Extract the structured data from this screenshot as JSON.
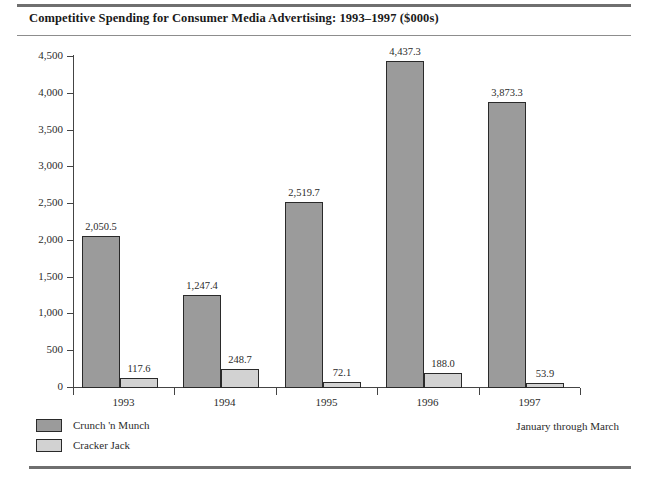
{
  "chart_data": {
    "type": "bar",
    "title": "Competitive Spending for Consumer Media Advertising: 1993–1997 ($000s)",
    "xlabel": "",
    "ylabel": "",
    "categories": [
      "1993",
      "1994",
      "1995",
      "1996",
      "1997"
    ],
    "series": [
      {
        "name": "Crunch 'n Munch",
        "color": "#9b9b9b",
        "values": [
          2050.5,
          1247.4,
          2519.7,
          4437.3,
          3873.3
        ],
        "labels": [
          "2,050.5",
          "1,247.4",
          "2,519.7",
          "4,437.3",
          "3,873.3"
        ]
      },
      {
        "name": "Cracker Jack",
        "color": "#d2d2d2",
        "values": [
          117.6,
          248.7,
          72.1,
          188.0,
          53.9
        ],
        "labels": [
          "117.6",
          "248.7",
          "72.1",
          "188.0",
          "53.9"
        ]
      }
    ],
    "ylim": [
      0,
      4500
    ],
    "yticks": [
      0,
      500,
      1000,
      1500,
      2000,
      2500,
      3000,
      3500,
      4000,
      4500
    ],
    "ytick_labels": [
      "0",
      "500",
      "1,000",
      "1,500",
      "2,000",
      "2,500",
      "3,000",
      "3,500",
      "4,000",
      "4,500"
    ],
    "grid": false,
    "legend_position": "bottom-left",
    "annotations": [
      "January through March"
    ]
  },
  "legend": {
    "items": [
      {
        "label": "Crunch 'n Munch",
        "swatch": "dark"
      },
      {
        "label": "Cracker Jack",
        "swatch": "light"
      }
    ]
  },
  "footnote": "January through March"
}
